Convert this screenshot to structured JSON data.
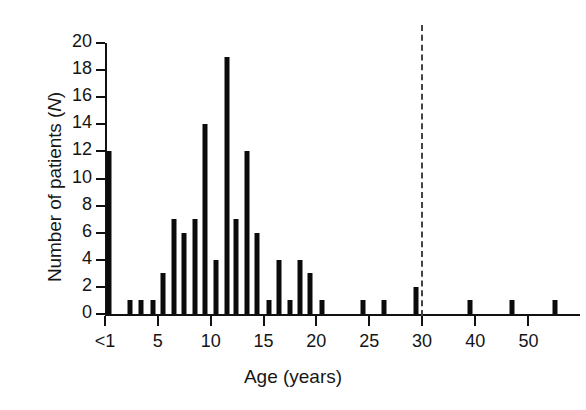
{
  "chart_data": {
    "type": "bar",
    "title": "",
    "subtitle": "",
    "xlabel": "Age (years)",
    "ylabel": "Number of patients (N)",
    "ylabel_italic_part": "N",
    "ylim": [
      0,
      20
    ],
    "ytick_values": [
      0,
      2,
      4,
      6,
      8,
      10,
      12,
      14,
      16,
      18,
      20
    ],
    "ytick_labels": [
      "0",
      "2",
      "4",
      "6",
      "8",
      "10",
      "12",
      "14",
      "16",
      "18",
      "20"
    ],
    "xtick_values": [
      0,
      5,
      10,
      15,
      20,
      25,
      30,
      40,
      50
    ],
    "xtick_labels": [
      "<1",
      "5",
      "10",
      "15",
      "20",
      "25",
      "30",
      "40",
      "50"
    ],
    "grid": false,
    "legend": false,
    "bar_color": "#0b0b0b",
    "annotation_line": {
      "name": "age-30-cutoff",
      "x": 30,
      "style": "dashed",
      "color": "#444444"
    },
    "axis_note": "x scale is linear 0-30 then compressed 30-55",
    "categories": [
      "<1",
      1,
      2,
      3,
      4,
      5,
      6,
      7,
      8,
      9,
      10,
      11,
      12,
      13,
      14,
      15,
      16,
      17,
      18,
      19,
      20,
      24,
      26,
      29,
      39,
      47,
      55
    ],
    "values": [
      12,
      0,
      1,
      1,
      1,
      3,
      7,
      6,
      7,
      14,
      4,
      19,
      7,
      12,
      6,
      1,
      4,
      1,
      4,
      3,
      1,
      1,
      1,
      2,
      1,
      1,
      1
    ],
    "points": [
      {
        "age": 0,
        "x": 0.4,
        "n": 12
      },
      {
        "age": 2,
        "x": 2.4,
        "n": 1
      },
      {
        "age": 3,
        "x": 3.4,
        "n": 1
      },
      {
        "age": 4,
        "x": 4.5,
        "n": 1
      },
      {
        "age": 5,
        "x": 5.5,
        "n": 3
      },
      {
        "age": 6,
        "x": 6.5,
        "n": 7
      },
      {
        "age": 7,
        "x": 7.5,
        "n": 6
      },
      {
        "age": 8,
        "x": 8.5,
        "n": 7
      },
      {
        "age": 9,
        "x": 9.5,
        "n": 14
      },
      {
        "age": 10,
        "x": 10.5,
        "n": 4
      },
      {
        "age": 11,
        "x": 11.5,
        "n": 19
      },
      {
        "age": 12,
        "x": 12.4,
        "n": 7
      },
      {
        "age": 13,
        "x": 13.4,
        "n": 12
      },
      {
        "age": 14,
        "x": 14.4,
        "n": 6
      },
      {
        "age": 15,
        "x": 15.5,
        "n": 1
      },
      {
        "age": 16,
        "x": 16.5,
        "n": 4
      },
      {
        "age": 17,
        "x": 17.5,
        "n": 1
      },
      {
        "age": 18,
        "x": 18.5,
        "n": 4
      },
      {
        "age": 19,
        "x": 19.4,
        "n": 3
      },
      {
        "age": 20,
        "x": 20.5,
        "n": 1
      },
      {
        "age": 24,
        "x": 24.4,
        "n": 1
      },
      {
        "age": 26,
        "x": 26.4,
        "n": 1
      },
      {
        "age": 29,
        "x": 29.4,
        "n": 2
      },
      {
        "age": 39,
        "x": 39,
        "n": 1
      },
      {
        "age": 47,
        "x": 47,
        "n": 1
      },
      {
        "age": 55,
        "x": 55,
        "n": 1
      }
    ]
  }
}
